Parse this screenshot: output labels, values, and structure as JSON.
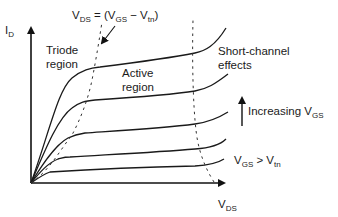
{
  "diagram": {
    "y_axis": {
      "label": "I",
      "sub": "D"
    },
    "x_axis": {
      "label": "V",
      "sub": "DS"
    },
    "boundary_eq": {
      "lhs": "V",
      "lhs_sub": "DS",
      "mid": " = (V",
      "sub1": "GS",
      "minus": " − V",
      "sub2": "tn",
      "close": ")"
    },
    "regions": {
      "triode_line1": "Triode",
      "triode_line2": "region",
      "active_line1": "Active",
      "active_line2": "region",
      "short_line1": "Short-channel",
      "short_line2": "effects"
    },
    "increasing": {
      "text": "Increasing V",
      "sub": "GS"
    },
    "condition": {
      "v1": "V",
      "sub1": "GS",
      "op": " > V",
      "sub2": "tn"
    },
    "curve_count": 5,
    "colors": {
      "ink": "#1a1a1a",
      "background": "#ffffff"
    }
  }
}
